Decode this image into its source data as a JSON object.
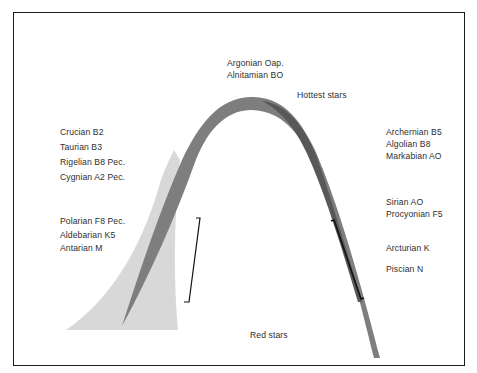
{
  "diagram": {
    "title_top": [
      "Argonian Oap.",
      "Alnitamian BO"
    ],
    "hottest_label": "Hottest stars",
    "bottom_label": "Red stars",
    "left_upper_group": [
      "Crucian B2",
      "Taurian B3",
      "Rigelian B8 Pec.",
      "Cygnian A2 Pec."
    ],
    "left_lower_group": [
      "Polarian F8 Pec.",
      "Aldebarian K5",
      "Antarian M"
    ],
    "right_upper_group": [
      "Archernian B5",
      "Algolian B8",
      "Markabian AO"
    ],
    "right_middle_group": [
      "Sirian AO",
      "Procyonian F5"
    ],
    "right_lower_group": [
      "Arcturian K",
      "Piscian N"
    ],
    "colors": {
      "frame": "#1a1a1a",
      "main_band": "#7c7c7c",
      "dark_band": "#555555",
      "light_band": "#d6d6d6",
      "bracket": "#111111",
      "text": "#2e2e2e"
    }
  }
}
